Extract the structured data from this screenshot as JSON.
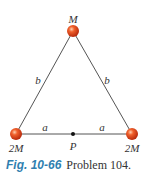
{
  "figure": {
    "masses": [
      {
        "id": "top",
        "label": "M",
        "x": 73,
        "y": 31
      },
      {
        "id": "bottom-left",
        "label": "2M",
        "x": 16,
        "y": 134
      },
      {
        "id": "bottom-right",
        "label": "2M",
        "x": 132,
        "y": 134
      }
    ],
    "point": {
      "label": "P",
      "x": 73,
      "y": 134
    },
    "sides": {
      "left": {
        "label": "b"
      },
      "right": {
        "label": "b"
      },
      "base_left": {
        "label": "a"
      },
      "base_right": {
        "label": "a"
      }
    },
    "colors": {
      "mass_fill": "#e8401c",
      "mass_highlight": "#ffb08a",
      "line": "#555555",
      "caption_fig": "#2f7fb0"
    }
  },
  "caption": {
    "fig_label": "Fig. 10-66",
    "text": "Problem 104."
  }
}
